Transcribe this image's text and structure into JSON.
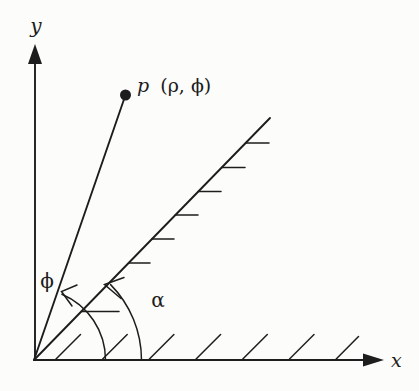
{
  "figure": {
    "background": "#fcfcfa",
    "ink": "#1d1d1d",
    "y_axis_label": "y",
    "x_axis_label": "x",
    "point_label": {
      "name": "p",
      "coordinates": "(ρ, ϕ)"
    },
    "phi_angle_label": "ϕ",
    "alpha_angle_label": "α"
  }
}
